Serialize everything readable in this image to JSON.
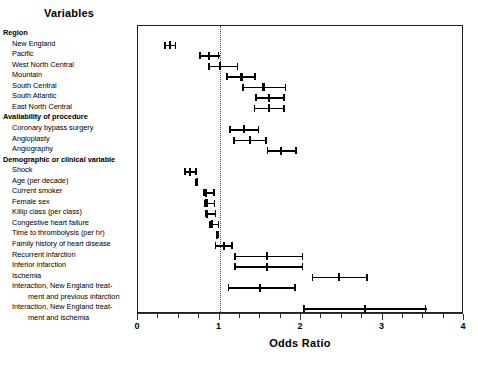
{
  "figure": {
    "variables_header": "Variables",
    "xlabel": "Odds Ratio",
    "reference_value": 1
  },
  "axis": {
    "tick_labels": [
      "0",
      "1",
      "2",
      "3",
      "4"
    ]
  },
  "chart_data": {
    "type": "scatter",
    "title": "Variables",
    "xlabel": "Odds Ratio",
    "ylabel": "",
    "xlim": [
      0,
      4
    ],
    "xticks": [
      0,
      1,
      2,
      3,
      4
    ],
    "xtick_labels": [
      "0",
      "1",
      "2",
      "3",
      "4"
    ],
    "minor_tick_step": 0.25,
    "grid": false,
    "legend": "none",
    "reference_line": {
      "x": 1,
      "style": "dotted"
    },
    "plot_style": "forest-plot: point estimate with horizontal 95% confidence interval and end caps",
    "groups": [
      {
        "name": "Region",
        "is_header": true
      },
      {
        "name": "Availability of procedure",
        "is_header": true
      },
      {
        "name": "Demographic or clinical variable",
        "is_header": true
      }
    ],
    "rows": [
      {
        "label": "Region",
        "type": "group",
        "indent": 0
      },
      {
        "label": "New England",
        "type": "data",
        "indent": 1,
        "or": 0.39,
        "lo": 0.32,
        "hi": 0.47
      },
      {
        "label": "Pacific",
        "type": "data",
        "indent": 1,
        "or": 0.87,
        "lo": 0.75,
        "hi": 1.0
      },
      {
        "label": "West North Central",
        "type": "data",
        "indent": 1,
        "or": 1.01,
        "lo": 0.86,
        "hi": 1.23
      },
      {
        "label": "Mountain",
        "type": "data",
        "indent": 1,
        "or": 1.27,
        "lo": 1.08,
        "hi": 1.45
      },
      {
        "label": "South Central",
        "type": "data",
        "indent": 1,
        "or": 1.54,
        "lo": 1.28,
        "hi": 1.82
      },
      {
        "label": "South Atlantic",
        "type": "data",
        "indent": 1,
        "or": 1.61,
        "lo": 1.44,
        "hi": 1.8
      },
      {
        "label": "East North Central",
        "type": "data",
        "indent": 1,
        "or": 1.61,
        "lo": 1.42,
        "hi": 1.8
      },
      {
        "label": "Availability of procedure",
        "type": "group",
        "indent": 0
      },
      {
        "label": "Coronary bypass surgery",
        "type": "data",
        "indent": 1,
        "or": 1.3,
        "lo": 1.12,
        "hi": 1.49
      },
      {
        "label": "Angioplasty",
        "type": "data",
        "indent": 1,
        "or": 1.37,
        "lo": 1.17,
        "hi": 1.58
      },
      {
        "label": "Angiography",
        "type": "data",
        "indent": 1,
        "or": 1.76,
        "lo": 1.58,
        "hi": 1.95
      },
      {
        "label": "Demographic or clinical variable",
        "type": "group",
        "indent": 0
      },
      {
        "label": "Shock",
        "type": "data",
        "indent": 1,
        "or": 0.64,
        "lo": 0.57,
        "hi": 0.72
      },
      {
        "label": "Age (per decade)",
        "type": "data",
        "indent": 1,
        "or": 0.72,
        "lo": 0.7,
        "hi": 0.74
      },
      {
        "label": "Current smoker",
        "type": "data",
        "indent": 1,
        "or": 0.83,
        "lo": 0.8,
        "hi": 0.94
      },
      {
        "label": "Female sex",
        "type": "data",
        "indent": 1,
        "or": 0.84,
        "lo": 0.81,
        "hi": 0.95
      },
      {
        "label": "Killip class (per class)",
        "type": "data",
        "indent": 1,
        "or": 0.85,
        "lo": 0.82,
        "hi": 0.96
      },
      {
        "label": "Congestive heart failure",
        "type": "data",
        "indent": 1,
        "or": 0.91,
        "lo": 0.87,
        "hi": 1.0
      },
      {
        "label": "Time to thrombolysis (per hr)",
        "type": "data",
        "indent": 1,
        "or": 0.97,
        "lo": 0.96,
        "hi": 0.99
      },
      {
        "label": "Family history of heart disease",
        "type": "data",
        "indent": 1,
        "or": 1.05,
        "lo": 0.94,
        "hi": 1.16
      },
      {
        "label": "Recurrent infarction",
        "type": "data",
        "indent": 1,
        "or": 1.58,
        "lo": 1.18,
        "hi": 2.03
      },
      {
        "label": "Inferior infarction",
        "type": "data",
        "indent": 1,
        "or": 1.58,
        "lo": 1.18,
        "hi": 2.03
      },
      {
        "label": "Ischemia",
        "type": "data",
        "indent": 1,
        "or": 2.47,
        "lo": 2.13,
        "hi": 2.82
      },
      {
        "label": "Interaction, New England treat-",
        "type": "data",
        "indent": 1,
        "or": 1.5,
        "lo": 1.1,
        "hi": 1.94,
        "continuation": "ment and previous infarction"
      },
      {
        "label": "Interaction, New England treat-",
        "type": "data",
        "indent": 1,
        "or": 2.78,
        "lo": 2.03,
        "hi": 3.54,
        "continuation": "ment and ischemia"
      }
    ]
  }
}
